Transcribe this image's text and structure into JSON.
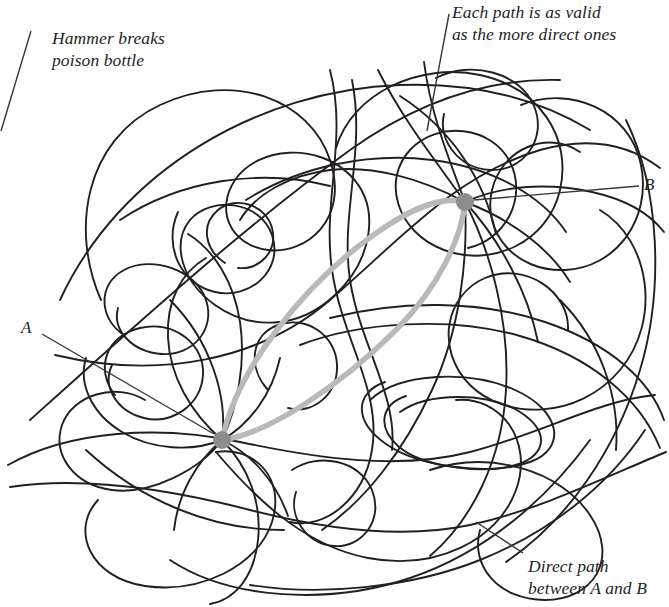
{
  "figure": {
    "width": 669,
    "height": 607,
    "background_color": "#ffffff",
    "tangle_line_color": "#231f1f",
    "highlight_path_color": "#b9b9b9",
    "node_color": "#8c8c8c",
    "leader_line_color": "#3a3636"
  },
  "annotations": [
    {
      "id": "hammer",
      "line1": "Hammer breaks",
      "line2": "poison bottle",
      "leader": {
        "x1": 31,
        "y1": 31,
        "x2": 1,
        "y2": 131
      }
    },
    {
      "id": "each-path",
      "line1": "Each path is as valid",
      "line2": "as the more direct ones",
      "leader": {
        "x1": 449,
        "y1": 14,
        "x2": 427,
        "y2": 131
      }
    },
    {
      "id": "direct-path",
      "line1": "Direct path",
      "line2": "between A and B",
      "leader": {
        "x1": 523,
        "y1": 553,
        "x2": 476,
        "y2": 522
      }
    }
  ],
  "nodes": [
    {
      "id": "A",
      "label": "A",
      "x": 222,
      "y": 440,
      "radius": 9,
      "leader": {
        "x1": 42,
        "y1": 334,
        "x2": 214,
        "y2": 434
      }
    },
    {
      "id": "B",
      "label": "B",
      "x": 465,
      "y": 202,
      "radius": 9,
      "leader": {
        "x1": 474,
        "y1": 200,
        "x2": 639,
        "y2": 186
      }
    }
  ],
  "highlight_paths": [
    {
      "id": "direct-upper",
      "description": "Gray path bowing above the straight line from A to B"
    },
    {
      "id": "direct-lower",
      "description": "Gray path bowing below the straight line from A to B"
    }
  ]
}
